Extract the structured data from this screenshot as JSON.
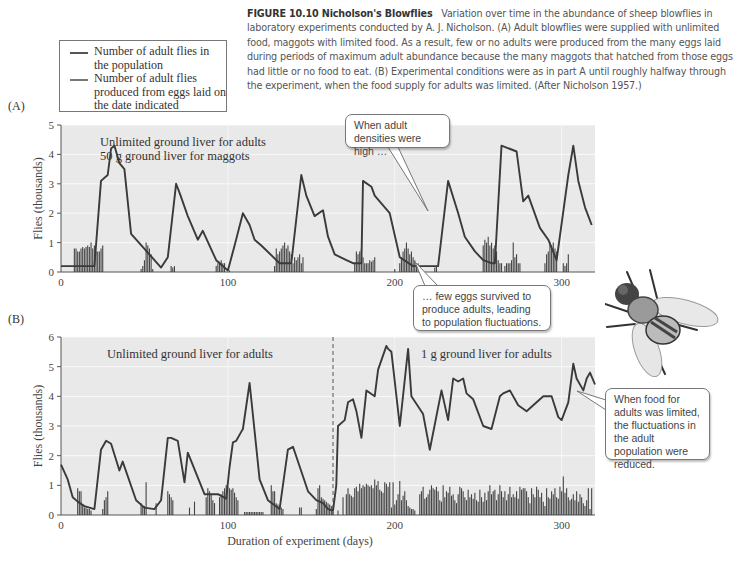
{
  "caption": {
    "figure_label": "FIGURE 10.10  Nicholson's Blowflies",
    "text": "Variation over time in the abundance of sheep blowflies in laboratory experiments conducted by A. J. Nicholson. (A) Adult blowflies were supplied with unlimited food, maggots with limited food. As a result, few or no adults were produced from the many eggs laid during periods of maximum adult abundance because the many maggots that hatched from those eggs had little or no food to eat. (B) Experimental conditions were as in part A until roughly halfway through the experiment, when the food supply for adults was limited. (After Nicholson 1957.)"
  },
  "legend": {
    "items": [
      {
        "label": "Number of adult flies in the population",
        "style": "line"
      },
      {
        "label": "Number of adult flies produced from eggs laid on the date indicated",
        "style": "bars"
      }
    ]
  },
  "callouts": {
    "a_high": "When adult densities were high …",
    "a_few": "… few eggs survived to produce adults, leading to population fluctuations.",
    "b_limited": "When food for adults was limited, the fluctuations in the adult population were reduced."
  },
  "chart_data": [
    {
      "type": "line",
      "panel": "A",
      "title": "(A)",
      "annotation": [
        "Unlimited ground liver for adults",
        "50 g ground liver for maggots"
      ],
      "xlabel": "",
      "ylabel": "Flies (thousands)",
      "xlim": [
        0,
        320
      ],
      "ylim": [
        0,
        5
      ],
      "xticks": [
        0,
        100,
        200,
        300
      ],
      "yticks": [
        0,
        1,
        2,
        3,
        4,
        5
      ],
      "grid": true,
      "series": [
        {
          "name": "Number of adult flies in the population",
          "type": "line",
          "x": [
            0,
            20,
            24,
            28,
            30,
            32,
            35,
            38,
            42,
            60,
            64,
            69,
            71,
            76,
            82,
            85,
            93,
            100,
            104,
            109,
            113,
            116,
            120,
            131,
            138,
            144,
            147,
            152,
            157,
            160,
            164,
            171,
            175,
            180,
            181,
            186,
            188,
            197,
            203,
            211,
            226,
            232,
            238,
            242,
            248,
            253,
            258,
            260,
            264,
            273,
            277,
            280,
            287,
            292,
            297,
            304,
            307,
            310,
            314,
            318
          ],
          "values": [
            0.2,
            0.2,
            3.1,
            3.3,
            4.2,
            4.3,
            3.7,
            3.5,
            1.3,
            0.15,
            0.5,
            3.0,
            2.7,
            1.9,
            1.1,
            1.4,
            0.4,
            0.05,
            0.9,
            2.0,
            1.6,
            1.1,
            0.9,
            0.3,
            0.3,
            3.3,
            2.6,
            1.9,
            2.1,
            1.2,
            0.6,
            0.4,
            0.3,
            0.3,
            3.1,
            2.9,
            2.6,
            2.0,
            0.5,
            0.2,
            0.2,
            3.1,
            2.0,
            1.2,
            0.7,
            0.4,
            0.3,
            0.3,
            4.3,
            4.1,
            2.4,
            2.6,
            1.5,
            1.1,
            0.4,
            3.3,
            4.3,
            3.1,
            2.2,
            1.6
          ]
        },
        {
          "name": "Number of adult flies produced from eggs laid on the date indicated",
          "type": "bar",
          "x": [
            8,
            9,
            10,
            11,
            12,
            13,
            14,
            15,
            16,
            17,
            18,
            19,
            20,
            21,
            22,
            23,
            24,
            25,
            48,
            49,
            50,
            51,
            52,
            53,
            54,
            55,
            66,
            67,
            68,
            93,
            94,
            95,
            96,
            97,
            98,
            101,
            128,
            129,
            130,
            131,
            132,
            133,
            134,
            135,
            136,
            137,
            138,
            139,
            140,
            141,
            142,
            143,
            144,
            145,
            176,
            177,
            178,
            179,
            180,
            181,
            182,
            183,
            184,
            185,
            186,
            187,
            188,
            200,
            203,
            204,
            205,
            206,
            207,
            208,
            209,
            210,
            211,
            212,
            213,
            214,
            215,
            224,
            225,
            253,
            254,
            255,
            256,
            257,
            258,
            259,
            260,
            261,
            262,
            263,
            264,
            266,
            267,
            268,
            269,
            270,
            271,
            272,
            273,
            274,
            275,
            290,
            291,
            292,
            293,
            294,
            295,
            296,
            297,
            301,
            302,
            303,
            304
          ],
          "values": [
            0.8,
            0.8,
            0.7,
            0.7,
            0.8,
            0.85,
            0.8,
            0.85,
            0.9,
            0.85,
            1.0,
            0.8,
            0.9,
            0.7,
            0.7,
            0.7,
            0.8,
            0.9,
            0.1,
            0.2,
            0.4,
            1.0,
            0.9,
            0.8,
            0.6,
            0.1,
            0.2,
            0.15,
            0.2,
            0.2,
            0.3,
            0.35,
            0.4,
            0.3,
            0.3,
            0.05,
            0.2,
            0.8,
            0.6,
            0.7,
            0.8,
            0.9,
            1.0,
            0.8,
            0.9,
            0.7,
            0.6,
            0.3,
            0.5,
            0.4,
            0.5,
            0.6,
            0.3,
            0.5,
            0.3,
            0.7,
            0.6,
            0.7,
            0.8,
            0.5,
            0.3,
            0.3,
            0.3,
            0.4,
            0.35,
            0.4,
            0.5,
            0.1,
            0.3,
            0.5,
            0.7,
            0.8,
            1.0,
            0.8,
            0.6,
            0.7,
            0.5,
            0.4,
            0.3,
            0.3,
            0.2,
            0.15,
            0.2,
            0.9,
            1.1,
            1.0,
            1.2,
            0.9,
            1.0,
            0.8,
            0.9,
            0.7,
            0.4,
            0.3,
            0.3,
            0.2,
            0.3,
            0.3,
            0.3,
            0.4,
            1.0,
            0.5,
            0.6,
            0.3,
            0.3,
            0.3,
            0.6,
            0.7,
            1.0,
            0.9,
            1.0,
            0.8,
            0.7,
            0.3,
            0.2,
            0.3,
            0.6,
            0.9
          ]
        }
      ]
    },
    {
      "type": "line",
      "panel": "B",
      "title": "(B)",
      "annotation": [
        "Unlimited ground liver for adults",
        "1 g ground liver for adults"
      ],
      "divider_day": 163,
      "xlabel": "Duration of experiment (days)",
      "ylabel": "Flies (thousands)",
      "xlim": [
        0,
        320
      ],
      "ylim": [
        0,
        6
      ],
      "xticks": [
        0,
        100,
        200,
        300
      ],
      "yticks": [
        0,
        1,
        2,
        3,
        4,
        5,
        6
      ],
      "grid": true,
      "series": [
        {
          "name": "Number of adult flies in the population",
          "type": "line",
          "x": [
            0,
            4,
            7,
            10,
            14,
            20,
            24,
            27,
            30,
            35,
            37,
            45,
            50,
            56,
            60,
            64,
            66,
            70,
            74,
            76,
            86,
            94,
            99,
            101,
            103,
            105,
            108,
            109,
            113,
            119,
            124,
            131,
            136,
            139,
            148,
            153,
            157,
            160,
            163,
            165,
            166,
            170,
            172,
            175,
            177,
            180,
            183,
            188,
            190,
            195,
            196,
            198,
            203,
            208,
            210,
            217,
            221,
            228,
            232,
            235,
            238,
            241,
            243,
            247,
            253,
            258,
            263,
            265,
            269,
            274,
            279,
            285,
            289,
            294,
            298,
            300,
            304,
            307,
            309,
            313,
            315,
            317,
            320
          ],
          "values": [
            1.7,
            1.2,
            0.6,
            0.45,
            0.3,
            0.2,
            2.2,
            2.5,
            2.4,
            1.5,
            1.8,
            0.5,
            0.25,
            0.2,
            0.5,
            2.6,
            2.6,
            2.5,
            1.1,
            2.1,
            0.7,
            0.7,
            0.55,
            1.6,
            2.45,
            2.5,
            2.8,
            2.9,
            4.45,
            1.2,
            0.5,
            0.2,
            2.2,
            2.3,
            0.8,
            0.5,
            0.4,
            0.2,
            0.15,
            1.0,
            3.0,
            3.2,
            3.8,
            3.9,
            3.5,
            2.6,
            4.2,
            4.0,
            4.9,
            5.7,
            5.6,
            5.5,
            3.0,
            5.6,
            4.0,
            3.4,
            2.2,
            4.2,
            3.2,
            4.6,
            4.5,
            4.6,
            4.1,
            3.9,
            3.0,
            2.9,
            4.0,
            4.1,
            4.2,
            3.7,
            3.5,
            3.8,
            4.0,
            4.0,
            3.3,
            3.2,
            3.8,
            5.1,
            4.6,
            4.2,
            4.6,
            4.8,
            4.4
          ]
        },
        {
          "name": "Number of adult flies produced from eggs laid on the date indicated",
          "type": "bar",
          "x": [
            10,
            11,
            12,
            13,
            14,
            15,
            16,
            17,
            18,
            25,
            26,
            27,
            28,
            48,
            49,
            50,
            51,
            57,
            64,
            65,
            66,
            67,
            77,
            80,
            87,
            88,
            89,
            90,
            91,
            92,
            95,
            96,
            97,
            98,
            99,
            100,
            101,
            102,
            103,
            104,
            105,
            106,
            110,
            111,
            112,
            113,
            114,
            115,
            116,
            117,
            118,
            119,
            120,
            121,
            126,
            127,
            128,
            129,
            130,
            131,
            132,
            133,
            143,
            144,
            153,
            154,
            155,
            156,
            157,
            158,
            159,
            160,
            161,
            162,
            163
          ],
          "values": [
            0.9,
            0.8,
            0.8,
            0.3,
            0.25,
            0.25,
            0.2,
            0.2,
            0.15,
            0.2,
            0.5,
            0.6,
            0.8,
            0.4,
            0.3,
            0.3,
            1.1,
            0.4,
            0.8,
            0.7,
            0.6,
            0.5,
            0.25,
            0.45,
            0.6,
            0.9,
            0.8,
            0.7,
            0.5,
            0.4,
            0.6,
            0.7,
            0.8,
            0.9,
            1.0,
            0.95,
            0.9,
            0.85,
            0.9,
            0.75,
            0.6,
            0.5,
            0.1,
            0.1,
            0.1,
            0.1,
            0.1,
            0.1,
            0.1,
            0.1,
            0.1,
            0.1,
            0.1,
            0.1,
            1.0,
            0.8,
            0.8,
            0.4,
            0.35,
            0.3,
            0.25,
            0.2,
            0.25,
            0.25,
            0.2,
            0.9,
            1.0,
            0.6,
            0.55,
            0.5,
            0.45,
            0.4,
            0.35,
            0.3,
            0.2
          ]
        },
        {
          "name": "Number of adult flies produced from eggs laid on the date indicated (after food limit)",
          "type": "bar",
          "x": [
            166,
            169,
            171,
            172,
            173,
            174,
            175,
            176,
            177,
            178,
            179,
            180,
            181,
            182,
            183,
            184,
            185,
            186,
            187,
            188,
            189,
            190,
            191,
            192,
            193,
            194,
            195,
            196,
            197,
            198,
            199,
            200,
            201,
            202,
            203,
            204,
            205,
            206,
            207,
            208,
            209,
            210,
            211,
            212,
            215,
            216,
            217,
            218,
            219,
            220,
            221,
            222,
            223,
            224,
            225,
            226,
            227,
            228,
            229,
            230,
            231,
            232,
            233,
            234,
            235,
            236,
            237,
            238,
            239,
            240,
            241,
            242,
            243,
            244,
            245,
            246,
            247,
            248,
            249,
            250,
            251,
            252,
            253,
            254,
            255,
            256,
            257,
            258,
            259,
            260,
            261,
            262,
            263,
            264,
            265,
            266,
            267,
            268,
            269,
            270,
            271,
            272,
            273,
            274,
            275,
            276,
            277,
            278,
            279,
            280,
            281,
            282,
            283,
            284,
            285,
            286,
            287,
            288,
            289,
            290,
            291,
            292,
            293,
            294,
            295,
            296,
            297,
            298,
            299,
            300,
            301,
            302,
            303,
            304,
            305,
            306,
            307,
            308,
            309,
            310,
            311,
            312,
            313,
            314,
            315,
            316,
            317,
            318
          ],
          "values": [
            0.15,
            0.6,
            0.7,
            0.9,
            0.7,
            0.65,
            0.6,
            0.9,
            0.95,
            0.8,
            1.05,
            0.9,
            1.0,
            0.95,
            1.05,
            1.0,
            0.95,
            1.0,
            0.9,
            1.2,
            1.0,
            1.15,
            0.85,
            0.8,
            0.75,
            1.1,
            1.05,
            0.95,
            1.1,
            0.25,
            1.1,
            0.35,
            0.5,
            0.7,
            1.15,
            0.5,
            0.65,
            0.8,
            0.5,
            0.3,
            0.25,
            0.2,
            0.2,
            0.15,
            0.7,
            0.8,
            0.95,
            0.55,
            0.6,
            0.7,
            0.85,
            1.0,
            0.9,
            0.85,
            0.95,
            0.8,
            0.5,
            0.45,
            1.0,
            0.6,
            0.8,
            0.75,
            0.95,
            0.65,
            0.7,
            0.5,
            0.4,
            0.7,
            0.95,
            0.9,
            0.8,
            0.6,
            0.5,
            0.85,
            0.6,
            0.7,
            0.55,
            0.75,
            0.5,
            0.45,
            0.85,
            0.6,
            0.45,
            0.75,
            0.5,
            0.8,
            1.0,
            0.7,
            0.8,
            0.85,
            0.5,
            0.7,
            1.0,
            0.8,
            0.6,
            0.8,
            0.5,
            0.7,
            0.95,
            0.6,
            0.7,
            0.6,
            0.8,
            0.55,
            0.95,
            0.85,
            0.9,
            0.9,
            0.8,
            0.6,
            0.4,
            0.9,
            0.7,
            0.6,
            0.95,
            0.85,
            0.6,
            0.75,
            0.45,
            0.3,
            0.9,
            0.6,
            0.55,
            0.8,
            0.7,
            0.9,
            0.6,
            0.55,
            0.95,
            0.8,
            1.3,
            0.75,
            0.9,
            0.6,
            0.5,
            0.55,
            0.7,
            0.5,
            0.8,
            0.45,
            0.7,
            0.6,
            0.4,
            0.3,
            0.5,
            0.9,
            0.2,
            0.9
          ]
        }
      ]
    }
  ]
}
